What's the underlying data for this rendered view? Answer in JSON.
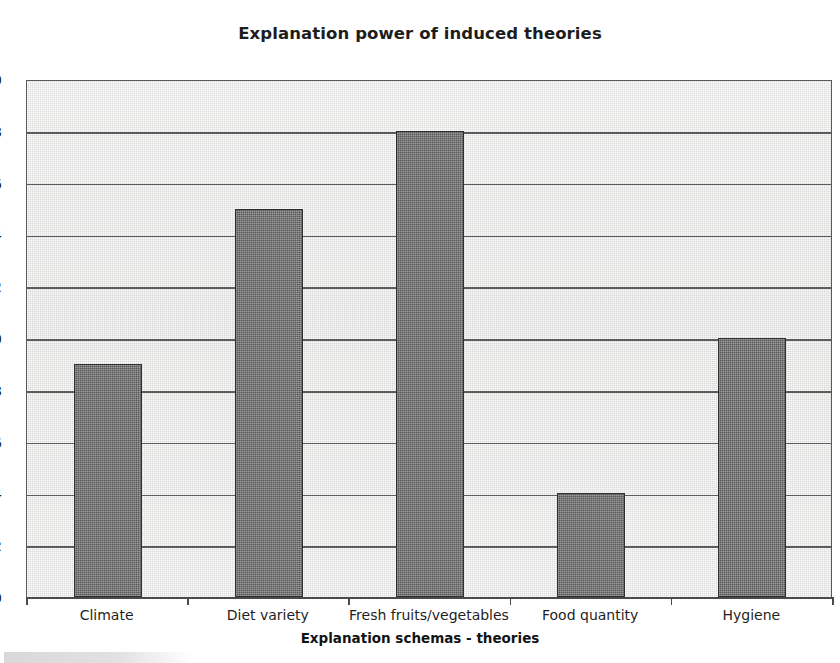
{
  "chart_data": {
    "type": "bar",
    "title": "Explanation power of induced theories",
    "xlabel": "Explanation schemas - theories",
    "ylabel": "",
    "categories": [
      "Climate",
      "Diet variety",
      "Fresh fruits/vegetables",
      "Food quantity",
      "Hygiene"
    ],
    "values": [
      0.9,
      1.5,
      1.8,
      0.4,
      1.0
    ],
    "ylim": [
      0,
      2.0
    ],
    "ytick_step": 0.2,
    "ytick_labels": [
      "2.0",
      "1.8",
      "1.6",
      "1.4",
      "1.2",
      "1.0",
      "0.8",
      "0.6",
      "0.4",
      "0.2",
      "0"
    ],
    "ytick_values": [
      2.0,
      1.8,
      1.6,
      1.4,
      1.2,
      1.0,
      0.8,
      0.6,
      0.4,
      0.2,
      0
    ],
    "grid": true,
    "legend": "none",
    "colors": {
      "bar_fill": "#6e6e6e",
      "bar_border": "#2f2f2f",
      "plot_background": "#d9d9d9",
      "gridline": "#5c5c5c",
      "text": "#1f1f1f"
    },
    "note": "Y axis tick labels are clipped at the left edge of the scanned image"
  }
}
